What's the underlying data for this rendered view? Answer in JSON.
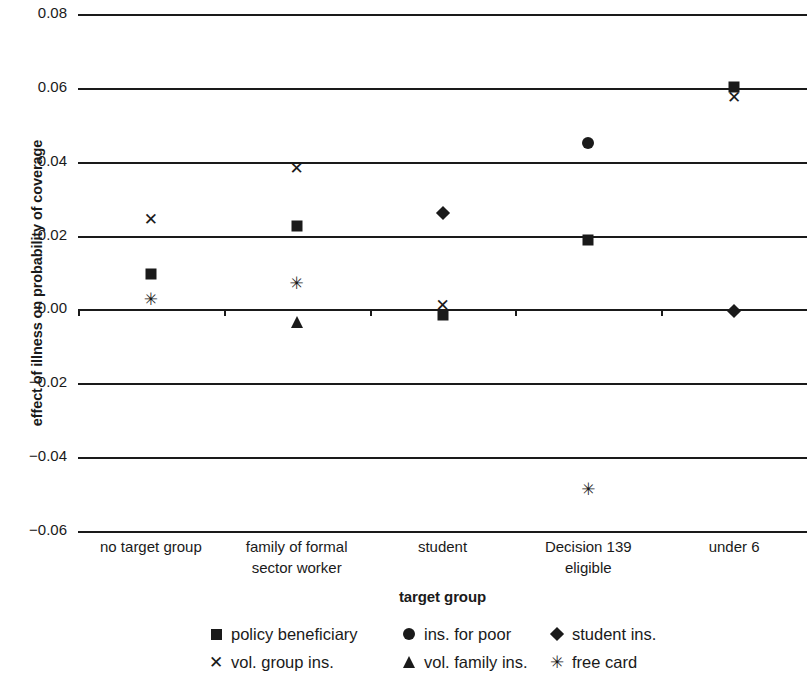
{
  "chart_data": {
    "type": "scatter",
    "title": "",
    "xlabel": "target group",
    "ylabel": "effect of illness on probability of coverage",
    "categories": [
      "no target group",
      "family of formal sector worker",
      "student",
      "Decision 139 eligible",
      "under 6"
    ],
    "category_lines": [
      [
        "no target group"
      ],
      [
        "family of formal",
        "sector worker"
      ],
      [
        "student"
      ],
      [
        "Decision 139",
        "eligible"
      ],
      [
        "under 6"
      ]
    ],
    "ylim": [
      -0.06,
      0.08
    ],
    "yticks": [
      0.08,
      0.06,
      0.04,
      0.02,
      0.0,
      -0.02,
      -0.04,
      -0.06
    ],
    "ytick_labels": [
      "0.08",
      "0.06",
      "0.04",
      "0.02",
      "0.00",
      "−0.02",
      "−0.04",
      "−0.06"
    ],
    "grid": true,
    "legend_position": "bottom",
    "series": [
      {
        "name": "policy beneficiary",
        "marker": "square",
        "points": [
          {
            "x": "no target group",
            "y": 0.0095
          },
          {
            "x": "family of formal sector worker",
            "y": 0.0225
          },
          {
            "x": "student",
            "y": -0.0015
          },
          {
            "x": "Decision 139 eligible",
            "y": 0.0188
          },
          {
            "x": "under 6",
            "y": 0.0602
          }
        ]
      },
      {
        "name": "ins. for poor",
        "marker": "circle",
        "points": [
          {
            "x": "Decision 139 eligible",
            "y": 0.045
          }
        ]
      },
      {
        "name": "student ins.",
        "marker": "diamond",
        "points": [
          {
            "x": "student",
            "y": 0.026
          },
          {
            "x": "under 6",
            "y": -0.0003
          }
        ]
      },
      {
        "name": "vol. group ins.",
        "marker": "x",
        "points": [
          {
            "x": "no target group",
            "y": 0.0243
          },
          {
            "x": "family of formal sector worker",
            "y": 0.038
          },
          {
            "x": "student",
            "y": 0.0009
          },
          {
            "x": "under 6",
            "y": 0.0572
          }
        ]
      },
      {
        "name": "vol. family ins.",
        "marker": "triangle",
        "points": [
          {
            "x": "family of formal sector worker",
            "y": -0.0033
          }
        ]
      },
      {
        "name": "free card",
        "marker": "asterisk",
        "points": [
          {
            "x": "no target group",
            "y": 0.0026
          },
          {
            "x": "family of formal sector worker",
            "y": 0.007
          },
          {
            "x": "Decision 139 eligible",
            "y": -0.049
          }
        ]
      }
    ]
  },
  "legend": {
    "entries": [
      {
        "label": "policy beneficiary",
        "marker": "square"
      },
      {
        "label": "ins. for poor",
        "marker": "circle"
      },
      {
        "label": "student ins.",
        "marker": "diamond"
      },
      {
        "label": "vol. group ins.",
        "marker": "x"
      },
      {
        "label": "vol. family ins.",
        "marker": "triangle"
      },
      {
        "label": "free card",
        "marker": "asterisk"
      }
    ]
  },
  "colors": {
    "ink": "#1a1a1a",
    "background": "#ffffff"
  }
}
